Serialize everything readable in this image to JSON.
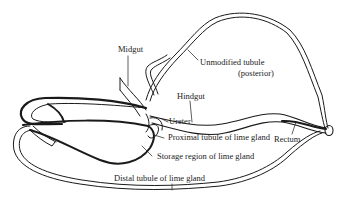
{
  "diagram": {
    "background": "#ffffff",
    "ink_color": "#1a1a1a",
    "labels": {
      "midgut": "Midgut",
      "unmodified_tubule": "Unmodified tubule",
      "posterior": "(posterior)",
      "hindgut": "Hindgut",
      "ureter": "Ureter",
      "rectum": "Rectum",
      "proximal_tubule": "Proximal tubule of lime gland",
      "storage_region": "Storage region of lime gland",
      "distal_tubule": "Distal tubule of lime gland"
    }
  }
}
